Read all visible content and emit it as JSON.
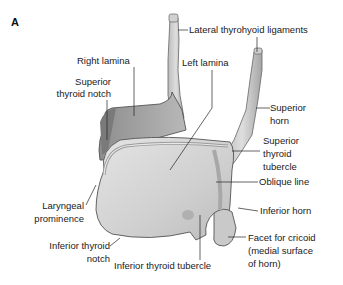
{
  "figure": {
    "panel_label": "A",
    "labels": {
      "lateral_thyrohyoid_ligaments": "Lateral thyrohyoid ligaments",
      "right_lamina": "Right lamina",
      "left_lamina": "Left lamina",
      "superior_thyroid_notch_1": "Superior",
      "superior_thyroid_notch_2": "thyroid notch",
      "superior_horn_1": "Superior",
      "superior_horn_2": "horn",
      "superior_thyroid_tubercle_1": "Superior",
      "superior_thyroid_tubercle_2": "thyroid",
      "superior_thyroid_tubercle_3": "tubercle",
      "oblique_line": "Oblique line",
      "inferior_horn": "Inferior horn",
      "facet_1": "Facet for cricoid",
      "facet_2": "(medial surface",
      "facet_3": "of horn)",
      "laryngeal_prominence_1": "Laryngeal",
      "laryngeal_prominence_2": "prominence",
      "inferior_thyroid_notch_1": "Inferior thyroid",
      "inferior_thyroid_notch_2": "notch",
      "inferior_thyroid_tubercle": "Inferior thyroid tubercle"
    },
    "colors": {
      "cartilage_light": "#d9d9d9",
      "cartilage_mid": "#bdbdbd",
      "cartilage_dark": "#8a8a8a",
      "outline": "#555555",
      "leader": "#222222"
    }
  }
}
